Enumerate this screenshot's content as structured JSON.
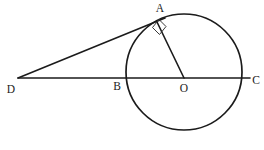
{
  "figure": {
    "kind": "geometry-diagram",
    "background_color": "#ffffff",
    "stroke_color": "#1b1b1b",
    "labels": {
      "A": "A",
      "B": "B",
      "C": "C",
      "D": "D",
      "O": "O"
    },
    "points": {
      "A": {
        "x": 158,
        "y": 22
      },
      "B": {
        "x": 126,
        "y": 78
      },
      "C": {
        "x": 237,
        "y": 78
      },
      "D": {
        "x": 18,
        "y": 78
      },
      "O": {
        "x": 184,
        "y": 78
      }
    },
    "label_positions": {
      "A": {
        "x": 160,
        "y": 12
      },
      "B": {
        "x": 117,
        "y": 90
      },
      "C": {
        "x": 256,
        "y": 84
      },
      "D": {
        "x": 11,
        "y": 93
      },
      "O": {
        "x": 184,
        "y": 92
      }
    },
    "circle": {
      "center_x": 184,
      "center_y": 72,
      "radius": 58
    },
    "segments": [
      {
        "name": "line-DC",
        "x1": 18,
        "y1": 78,
        "x2": 250,
        "y2": 78
      },
      {
        "name": "tangent-DA",
        "x1": 18,
        "y1": 78,
        "x2": 165,
        "y2": 18
      },
      {
        "name": "radius-OA",
        "x1": 184,
        "y1": 78,
        "x2": 157,
        "y2": 22
      }
    ],
    "right_angle_marker": {
      "name": "right-angle-at-A",
      "points": "152,28 159,35 166,27 159,20"
    }
  }
}
